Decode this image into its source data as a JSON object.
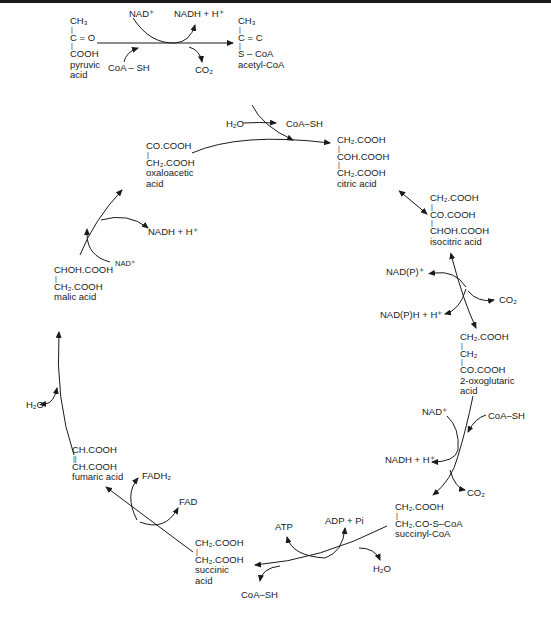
{
  "diagram": {
    "colors": {
      "ink": "#1a1a1a",
      "background": "#ffffff"
    }
  },
  "molecules": {
    "pyruvic": {
      "lines": [
        "CH₃",
        "C = O",
        "COOH"
      ],
      "name1": "pyruvic",
      "name2": "acid"
    },
    "acetyl_coa": {
      "lines": [
        "CH₃",
        "C = C",
        "S – C͏oA"
      ],
      "name1": "acetyl-CoA"
    },
    "citric": {
      "lines": [
        "CH₂.COOH",
        "COH.COOH",
        "CH₂.COOH"
      ],
      "name1": "citric acid"
    },
    "isocitric": {
      "lines": [
        "CH₂.COOH",
        "CO.COOH",
        "CHOH.COOH"
      ],
      "name1": "isocitric acid"
    },
    "oxoglutaric": {
      "lines": [
        "CH₂.COOH",
        "CH₂",
        "CO.COOH"
      ],
      "name1": "2-oxoglutaric",
      "name2": "acid"
    },
    "succinyl_coa": {
      "lines": [
        "CH₂.COOH",
        "CH₂.CO-S–CoA"
      ],
      "name1": "succinyl-CoA"
    },
    "succinic": {
      "lines": [
        "CH₂.COOH",
        "CH₂.COOH"
      ],
      "name1": "succinic",
      "name2": "acid"
    },
    "fumaric": {
      "lines": [
        "CH.COOH",
        "CH.COOH"
      ],
      "name1": "fumaric acid"
    },
    "malic": {
      "lines": [
        "CHOH.COOH",
        "CH₂.COOH"
      ],
      "name1": "malic acid"
    },
    "oxaloacetic": {
      "lines": [
        "CO.COOH",
        "CH₂.COOH"
      ],
      "name1": "oxaloacetic",
      "name2": "acid"
    }
  },
  "cofactors": {
    "pdh_nad": "NAD⁺",
    "pdh_nadh": "NADH + H⁺",
    "pdh_coash": "CoA – SH",
    "pdh_co2": "CO₂",
    "cs_h2o": "H₂O",
    "cs_coash": "CoA–SH",
    "idh_nadp": "NAD(P)⁺",
    "idh_nadph": "NAD(P)H + H⁺",
    "idh_co2": "CO₂",
    "ogdh_nad": "NAD⁺",
    "ogdh_coash": "CoA–SH",
    "ogdh_nadh": "NADH + H⁺",
    "ogdh_co2": "CO₂",
    "scs_atp": "ATP",
    "scs_adp": "ADP + Pi",
    "scs_h2o": "H₂O",
    "scs_coash": "CoA–SH",
    "sdh_fadh2": "FADH₂",
    "sdh_fad": "FAD",
    "fum_h2o": "H₂O",
    "mdh_nad": "NAD⁺",
    "mdh_nadh": "NADH + H⁺"
  }
}
